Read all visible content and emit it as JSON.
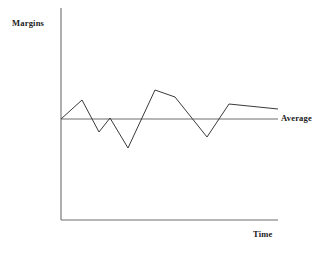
{
  "figure": {
    "title": "",
    "background_color": "#ffffff",
    "line_color": "#3a3a3a",
    "axis_color": "#6e6e6e",
    "text_color": "#1a1a1a"
  },
  "labels": {
    "y_axis_title": "Margins",
    "x_axis_title": "Time",
    "average_line": "Average"
  },
  "chart_data": {
    "type": "line",
    "title": "",
    "xlabel": "Time",
    "ylabel": "Margins",
    "grid": false,
    "legend": "none",
    "axis_ticks": {
      "x": [],
      "y": []
    },
    "xlim": [
      0,
      100
    ],
    "ylim": [
      0,
      100
    ],
    "series": [
      {
        "name": "Margins",
        "color": "#3a3a3a",
        "x": [
          0,
          9.7,
          17.5,
          22.6,
          30.9,
          43.3,
          52.5,
          67.3,
          77.4,
          100
        ],
        "y": [
          50,
          67.5,
          37.4,
          50.9,
          22.4,
          77.6,
          70.6,
          33.6,
          64.5,
          59.8
        ]
      },
      {
        "name": "Average",
        "color": "#6e6e6e",
        "x": [
          0,
          100
        ],
        "y": [
          50,
          50
        ],
        "style": "straight-horizontal"
      }
    ],
    "annotations": [
      {
        "text": "Margins",
        "position": "y-axis-top-left"
      },
      {
        "text": "Time",
        "position": "x-axis-right-below"
      },
      {
        "text": "Average",
        "position": "average-line-right-end"
      }
    ]
  },
  "geometry": {
    "axis": {
      "y_axis_x": 61,
      "y_axis_top": 8,
      "y_axis_bottom": 220,
      "x_axis_y": 220,
      "x_axis_left": 61,
      "x_axis_right": 278
    },
    "average_line": {
      "y": 119,
      "x_start": 61,
      "x_end": 278
    },
    "data_polyline": [
      [
        61,
        119
      ],
      [
        82,
        100
      ],
      [
        99,
        132
      ],
      [
        110,
        118
      ],
      [
        128,
        148
      ],
      [
        155,
        90
      ],
      [
        175,
        97
      ],
      [
        207,
        137
      ],
      [
        229,
        104
      ],
      [
        278,
        109
      ]
    ]
  }
}
